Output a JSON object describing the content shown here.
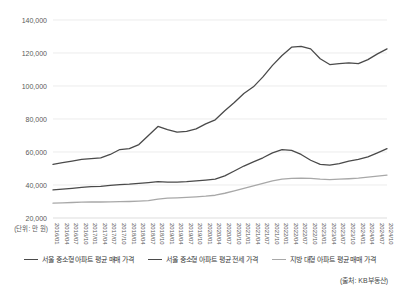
{
  "chart_data": {
    "type": "line",
    "title": "",
    "xlabel": "",
    "ylabel": "",
    "unit_note": "(단위: 만 원)",
    "source": "(출처: KB부동산)",
    "ylim": [
      20000,
      140000
    ],
    "yticks": [
      "20,000",
      "40,000",
      "60,000",
      "80,000",
      "100,000",
      "120,000",
      "140,000"
    ],
    "ytick_values": [
      20000,
      40000,
      60000,
      80000,
      100000,
      120000,
      140000
    ],
    "grid": true,
    "legend_position": "bottom",
    "categories": [
      "2016/01",
      "2016/04",
      "2016/07",
      "2016/10",
      "2017/01",
      "2017/04",
      "2017/07",
      "2017/10",
      "2018/01",
      "2018/04",
      "2018/07",
      "2018/10",
      "2019/01",
      "2019/04",
      "2019/07",
      "2019/10",
      "2020/01",
      "2020/04",
      "2020/07",
      "2020/10",
      "2021/01",
      "2021/04",
      "2021/07",
      "2021/10",
      "2022/01",
      "2022/04",
      "2022/07",
      "2022/10",
      "2023/01",
      "2023/04",
      "2023/07",
      "2023/10",
      "2024/01",
      "2024/04",
      "2024/07",
      "2024/10"
    ],
    "series": [
      {
        "name": "서울 중소형 아파트 평균 매매 가격",
        "color": "#4a4a4a",
        "values": [
          52500,
          53500,
          54500,
          55500,
          56000,
          56500,
          58500,
          61500,
          62000,
          64500,
          70000,
          75500,
          73500,
          72000,
          72500,
          74000,
          77000,
          79500,
          85000,
          90000,
          95500,
          99500,
          105500,
          112500,
          118500,
          123500,
          124000,
          122500,
          116500,
          113000,
          113500,
          114000,
          113500,
          116000,
          119500,
          122500
        ]
      },
      {
        "name": "서울 중소형 아파트 평균 전세 가격",
        "color": "#4a4a4a",
        "values": [
          37000,
          37500,
          38000,
          38500,
          39000,
          39200,
          39800,
          40200,
          40500,
          41000,
          41500,
          42000,
          41800,
          41800,
          42000,
          42500,
          43000,
          43500,
          45500,
          48500,
          51500,
          54000,
          56500,
          59500,
          61500,
          61000,
          58500,
          55000,
          52500,
          52000,
          53000,
          54500,
          55500,
          57000,
          59500,
          62000
        ]
      },
      {
        "name": "지방 대형 아파트 평균 매매 가격",
        "color": "#a8a8a8",
        "values": [
          29000,
          29200,
          29400,
          29600,
          29700,
          29700,
          29800,
          29900,
          30000,
          30200,
          30500,
          31500,
          32000,
          32200,
          32500,
          32800,
          33200,
          33800,
          35000,
          36500,
          38000,
          39500,
          41000,
          42500,
          43500,
          44000,
          44200,
          44000,
          43500,
          43200,
          43500,
          43800,
          44200,
          44800,
          45400,
          46000
        ]
      }
    ]
  },
  "legend": {
    "items": [
      {
        "label": "서울 중소형 아파트 평균 매매 가격",
        "color": "#4a4a4a"
      },
      {
        "label": "서울 중소형 아파트 평균 전세 가격",
        "color": "#4a4a4a"
      },
      {
        "label": "지방 대형 아파트 평균 매매 가격",
        "color": "#a8a8a8"
      }
    ]
  }
}
